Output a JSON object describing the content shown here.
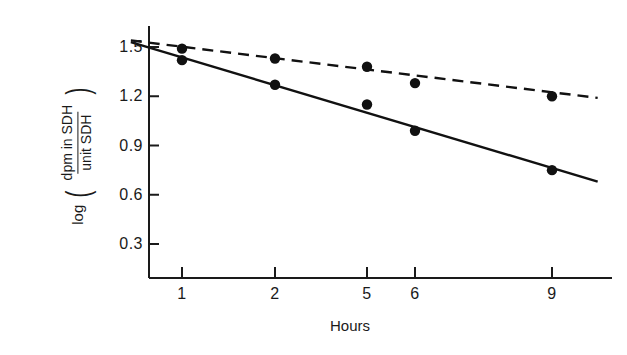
{
  "chart_data": {
    "type": "scatter",
    "title": "",
    "xlabel": "Hours",
    "ylabel_prefix": "log",
    "ylabel_numerator": "dpm in SDH",
    "ylabel_denominator": "unit SDH",
    "x_tick_labels": [
      "1",
      "2",
      "5",
      "6",
      "9"
    ],
    "x_tick_values": [
      1,
      2,
      5,
      6,
      9
    ],
    "y_tick_labels": [
      "0.3",
      "0.6",
      "0.9",
      "1.2",
      "1.5"
    ],
    "y_tick_values": [
      0.3,
      0.6,
      0.9,
      1.2,
      1.5
    ],
    "ylim": [
      0.0,
      1.62
    ],
    "grid": false,
    "legend": "none",
    "series": [
      {
        "name": "solid-line-series",
        "line_style": "solid",
        "marker": "filled-circle",
        "color": "#111111",
        "x": [
          1,
          2,
          5,
          6,
          9
        ],
        "values": [
          1.42,
          1.27,
          1.15,
          0.99,
          0.75
        ],
        "fit_start": {
          "x": 0.45,
          "y": 1.53
        },
        "fit_end": {
          "x": 10.0,
          "y": 0.68
        }
      },
      {
        "name": "dashed-line-series",
        "line_style": "dashed",
        "marker": "filled-circle",
        "color": "#111111",
        "x": [
          1,
          2,
          5,
          6,
          9
        ],
        "values": [
          1.49,
          1.43,
          1.38,
          1.28,
          1.2
        ],
        "fit_start": {
          "x": 0.45,
          "y": 1.54
        },
        "fit_end": {
          "x": 10.0,
          "y": 1.19
        }
      }
    ]
  }
}
